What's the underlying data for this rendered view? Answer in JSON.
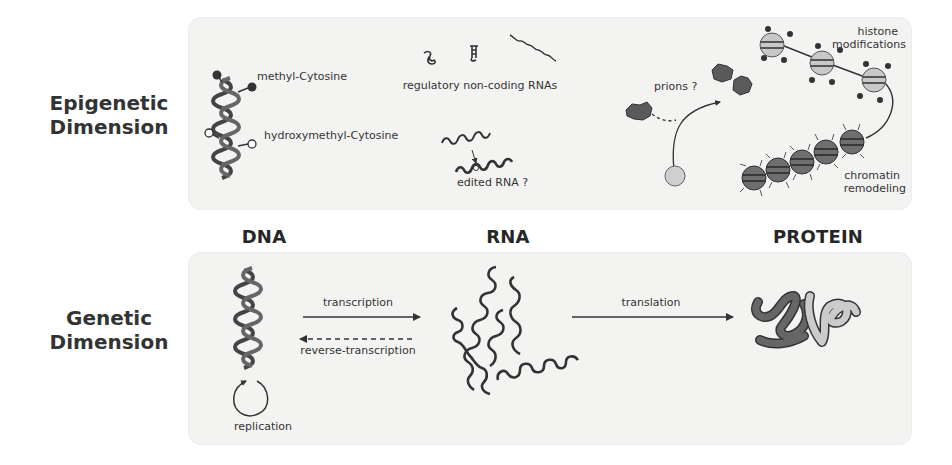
{
  "rows": {
    "epigenetic": {
      "line1": "Epigenetic",
      "line2": "Dimension"
    },
    "genetic": {
      "line1": "Genetic",
      "line2": "Dimension"
    }
  },
  "columns": {
    "dna": "DNA",
    "rna": "RNA",
    "protein": "PROTEIN"
  },
  "epigenetic_labels": {
    "methyl": "methyl-Cytosine",
    "hydroxymethyl": "hydroxymethyl-Cytosine",
    "ncrna": "regulatory non-coding RNAs",
    "edited_rna": "edited RNA ?",
    "prions": "prions ?",
    "histone_line1": "histone",
    "histone_line2": "modifications",
    "chromatin_line1": "chromatin",
    "chromatin_line2": "remodeling"
  },
  "genetic_labels": {
    "transcription": "transcription",
    "reverse_transcription": "reverse-transcription",
    "replication": "replication",
    "translation": "translation"
  },
  "colors": {
    "panel_bg": "#f3f3f2",
    "ink": "#2b2b2b",
    "dark_gray": "#555555",
    "mid_gray": "#6e6e6e",
    "light_gray": "#c9c9c9"
  }
}
